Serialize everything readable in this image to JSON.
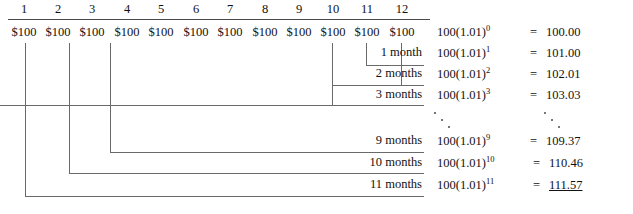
{
  "diagram": {
    "currency_symbol": "$",
    "periods": [
      {
        "num": "1",
        "payment": "$100"
      },
      {
        "num": "2",
        "payment": "$100"
      },
      {
        "num": "3",
        "payment": "$100"
      },
      {
        "num": "4",
        "payment": "$100"
      },
      {
        "num": "5",
        "payment": "$100"
      },
      {
        "num": "6",
        "payment": "$100"
      },
      {
        "num": "7",
        "payment": "$100"
      },
      {
        "num": "8",
        "payment": "$100"
      },
      {
        "num": "9",
        "payment": "$100"
      },
      {
        "num": "10",
        "payment": "$100"
      },
      {
        "num": "11",
        "payment": "$100"
      },
      {
        "num": "12",
        "payment": "$100"
      }
    ],
    "rows": [
      {
        "duration": "",
        "base": "100(1.01)",
        "exponent": "0",
        "eq": "=",
        "value": "100.00",
        "underlined": false
      },
      {
        "duration": "1 month",
        "base": "100(1.01)",
        "exponent": "1",
        "eq": "=",
        "value": "101.00",
        "underlined": false
      },
      {
        "duration": "2 months",
        "base": "100(1.01)",
        "exponent": "2",
        "eq": "=",
        "value": "102.01",
        "underlined": false
      },
      {
        "duration": "3 months",
        "base": "100(1.01)",
        "exponent": "3",
        "eq": "=",
        "value": "103.03",
        "underlined": false
      },
      {
        "duration": "9 months",
        "base": "100(1.01)",
        "exponent": "9",
        "eq": "=",
        "value": "109.37",
        "underlined": false
      },
      {
        "duration": "10 months",
        "base": "100(1.01)",
        "exponent": "10",
        "eq": "=",
        "value": "110.46",
        "underlined": false
      },
      {
        "duration": "11 months",
        "base": "100(1.01)",
        "exponent": "11",
        "eq": "=",
        "value": "111.57",
        "underlined": true
      }
    ],
    "line_color": "#6a6a6a"
  }
}
